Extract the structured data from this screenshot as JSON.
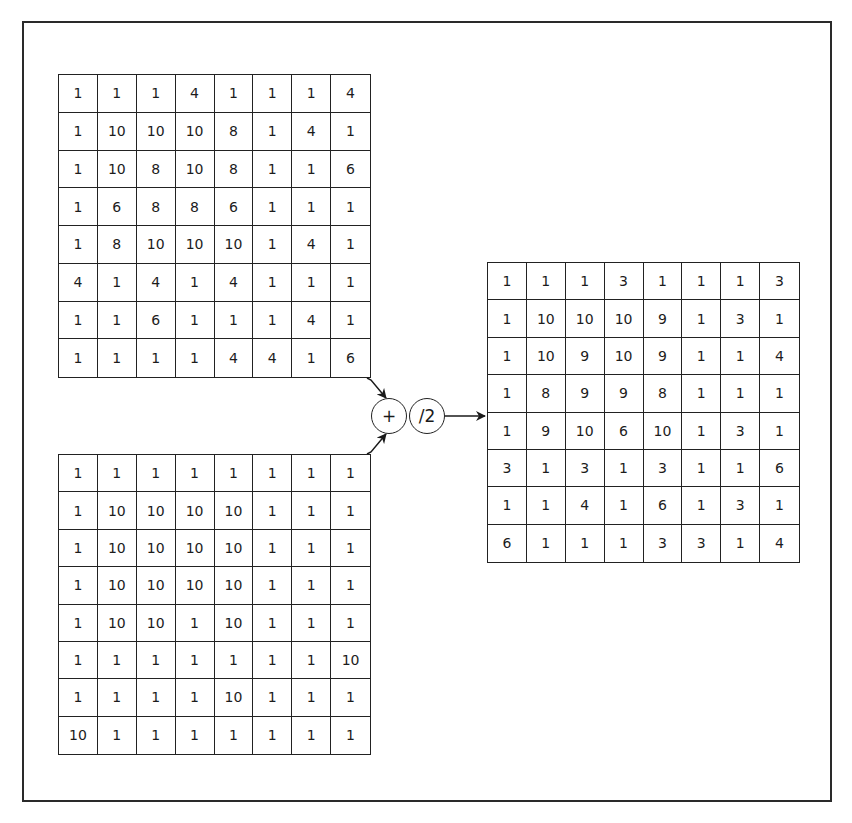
{
  "diagram": {
    "operators": {
      "add": "+",
      "divide": "/2"
    },
    "matrix_a": [
      [
        1,
        1,
        1,
        4,
        1,
        1,
        1,
        4
      ],
      [
        1,
        10,
        10,
        10,
        8,
        1,
        4,
        1
      ],
      [
        1,
        10,
        8,
        10,
        8,
        1,
        1,
        6
      ],
      [
        1,
        6,
        8,
        8,
        6,
        1,
        1,
        1
      ],
      [
        1,
        8,
        10,
        10,
        10,
        1,
        4,
        1
      ],
      [
        4,
        1,
        4,
        1,
        4,
        1,
        1,
        1
      ],
      [
        1,
        1,
        6,
        1,
        1,
        1,
        4,
        1
      ],
      [
        1,
        1,
        1,
        1,
        4,
        4,
        1,
        6
      ]
    ],
    "matrix_b": [
      [
        1,
        1,
        1,
        1,
        1,
        1,
        1,
        1
      ],
      [
        1,
        10,
        10,
        10,
        10,
        1,
        1,
        1
      ],
      [
        1,
        10,
        10,
        10,
        10,
        1,
        1,
        1
      ],
      [
        1,
        10,
        10,
        10,
        10,
        1,
        1,
        1
      ],
      [
        1,
        10,
        10,
        1,
        10,
        1,
        1,
        1
      ],
      [
        1,
        1,
        1,
        1,
        1,
        1,
        1,
        10
      ],
      [
        1,
        1,
        1,
        1,
        10,
        1,
        1,
        1
      ],
      [
        10,
        1,
        1,
        1,
        1,
        1,
        1,
        1
      ]
    ],
    "matrix_result": [
      [
        1,
        1,
        1,
        3,
        1,
        1,
        1,
        3
      ],
      [
        1,
        10,
        10,
        10,
        9,
        1,
        3,
        1
      ],
      [
        1,
        10,
        9,
        10,
        9,
        1,
        1,
        4
      ],
      [
        1,
        8,
        9,
        9,
        8,
        1,
        1,
        1
      ],
      [
        1,
        9,
        10,
        6,
        10,
        1,
        3,
        1
      ],
      [
        3,
        1,
        3,
        1,
        3,
        1,
        1,
        6
      ],
      [
        1,
        1,
        4,
        1,
        6,
        1,
        3,
        1
      ],
      [
        6,
        1,
        1,
        1,
        3,
        3,
        1,
        4
      ]
    ]
  }
}
